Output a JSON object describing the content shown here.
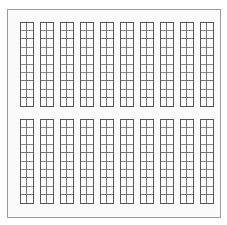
{
  "drawing": {
    "title": "Parking Layout Plan",
    "type": "architectural-plan",
    "canvas": {
      "width": 227,
      "height": 225,
      "background": "#ffffff"
    },
    "frame": {
      "label": "Site Boundary",
      "x": 7,
      "y": 9,
      "width": 213,
      "height": 208,
      "fill": "#fbfbfb",
      "stroke": "#9a9a9a",
      "stroke_width": 1
    },
    "geometry": {
      "column_count": 10,
      "cells_per_column_width": 2,
      "rows_per_block": 10,
      "block_count": 2,
      "column_width": 13,
      "column_pitch": 20,
      "cell_height": 8.4,
      "first_column_x": 20,
      "cell_fill": "#ffffff",
      "cell_stroke": "#6e6e6e",
      "cell_stroke_width": 0.8,
      "outline_stroke": "#555555",
      "outline_stroke_width": 1
    },
    "blocks": [
      {
        "name": "upper-bay-block",
        "label": "Upper Bay Block",
        "top": 22,
        "bottom": 106,
        "rows": 10,
        "columns": 10
      },
      {
        "name": "lower-bay-block",
        "label": "Lower Bay Block",
        "top": 119,
        "bottom": 203,
        "rows": 10,
        "columns": 10
      }
    ],
    "aisle": {
      "label": "Central Aisle",
      "top": 106,
      "bottom": 119,
      "height": 13
    },
    "columns": [
      {
        "index": 1,
        "label": "Column 1",
        "x": 20
      },
      {
        "index": 2,
        "label": "Column 2",
        "x": 40
      },
      {
        "index": 3,
        "label": "Column 3",
        "x": 60
      },
      {
        "index": 4,
        "label": "Column 4",
        "x": 80
      },
      {
        "index": 5,
        "label": "Column 5",
        "x": 100
      },
      {
        "index": 6,
        "label": "Column 6",
        "x": 120
      },
      {
        "index": 7,
        "label": "Column 7",
        "x": 140
      },
      {
        "index": 8,
        "label": "Column 8",
        "x": 160
      },
      {
        "index": 9,
        "label": "Column 9",
        "x": 180
      },
      {
        "index": 10,
        "label": "Column 10",
        "x": 200
      }
    ]
  }
}
